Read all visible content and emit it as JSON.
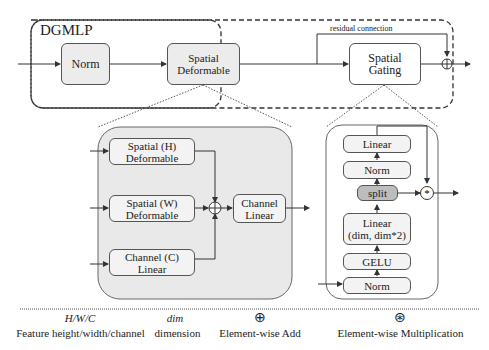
{
  "top": {
    "title": "DGMLP",
    "norm": "Norm",
    "spatial_deformable": "Spatial\nDeformable",
    "spatial_gating": "Spatial\nGating",
    "residual": "residual connection"
  },
  "left": {
    "h": "Spatial (H)\nDeformable",
    "w": "Spatial (W)\nDeformable",
    "c": "Channel (C)\nLinear",
    "channel_linear": "Channel\nLinear"
  },
  "right": {
    "linear_top": "Linear",
    "norm_mid": "Norm",
    "split": "split",
    "linear_dim": "Linear\n(dim, dim*2)",
    "gelu": "GELU",
    "norm_bottom": "Norm"
  },
  "legend": [
    {
      "symbol": "H/W/C",
      "text": "Feature height/width/channel"
    },
    {
      "symbol": "dim",
      "text": "dimension"
    },
    {
      "symbol": "⊕",
      "text": "Element-wise Add"
    },
    {
      "symbol": "⊛",
      "text": "Element-wise Multiplication"
    }
  ]
}
